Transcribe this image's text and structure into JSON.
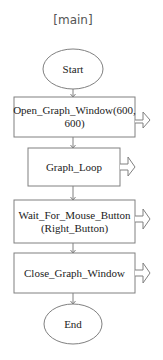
{
  "title": "[main]",
  "nodes": [
    {
      "id": "start",
      "type": "terminal",
      "label": "Start"
    },
    {
      "id": "open",
      "type": "process",
      "label": "Open_Graph_Window(600, 600)"
    },
    {
      "id": "loop",
      "type": "process",
      "label": "Graph_Loop"
    },
    {
      "id": "wait",
      "type": "process",
      "label": "Wait_For_Mouse_Button (Right_Button)"
    },
    {
      "id": "close",
      "type": "process",
      "label": "Close_Graph_Window"
    },
    {
      "id": "end",
      "type": "terminal",
      "label": "End"
    }
  ],
  "colors": {
    "stroke": "#808080",
    "text": "#222222",
    "background": "#ffffff"
  }
}
